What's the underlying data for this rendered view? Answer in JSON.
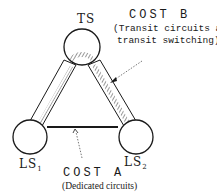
{
  "nodes": {
    "ts": {
      "label": "TS"
    },
    "ls1": {
      "label": "LS",
      "sub": "1"
    },
    "ls2": {
      "label": "LS",
      "sub": "2"
    }
  },
  "cost_b": {
    "title": "COST B",
    "desc_line1": "(Transit circuits and",
    "desc_line2": "transit switching)",
    "marker": "*"
  },
  "cost_a": {
    "title": "COST A",
    "desc": "(Dedicated circuits)"
  },
  "colors": {
    "ink": "#1a1a1a",
    "background": "#ffffff"
  }
}
